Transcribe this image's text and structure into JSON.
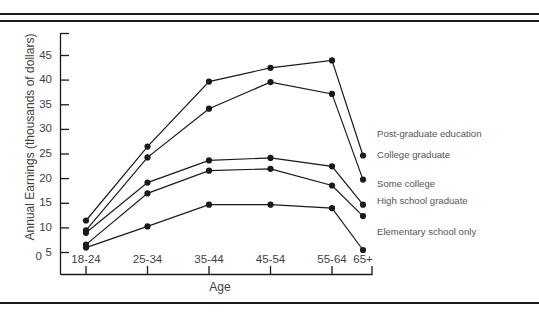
{
  "page": {
    "top_fragment": "",
    "rules": {
      "color": "#1a1a1a"
    }
  },
  "chart_data": {
    "type": "line",
    "title": "",
    "xlabel": "Age",
    "ylabel": "Annual Earnings (thousands of dollars)",
    "categories": [
      "18-24",
      "25-34",
      "35-44",
      "45-54",
      "55-64",
      "65+"
    ],
    "ytick_labels": [
      "45",
      "40",
      "35",
      "30",
      "25",
      "20",
      "15",
      "10",
      "5"
    ],
    "ytick_values": [
      45,
      40,
      35,
      30,
      25,
      20,
      15,
      10,
      5
    ],
    "y_origin_label": "0",
    "ylim": [
      0,
      46
    ],
    "grid": false,
    "legend_position": "right-of-line-ends",
    "marker": "filled-circle",
    "line_color": "#1a1a1a",
    "marker_color": "#1a1a1a",
    "series": [
      {
        "name": "Post-graduate education",
        "values": [
          11.5,
          26.5,
          39.7,
          42.5,
          44.0,
          24.7
        ]
      },
      {
        "name": "College graduate",
        "values": [
          9.5,
          24.3,
          34.2,
          39.6,
          37.2,
          19.8
        ]
      },
      {
        "name": "Some college",
        "values": [
          9.0,
          19.2,
          23.7,
          24.2,
          22.5,
          14.7
        ]
      },
      {
        "name": "High school graduate",
        "values": [
          6.6,
          17.0,
          21.6,
          22.0,
          18.6,
          12.4
        ]
      },
      {
        "name": "Elementary school only",
        "values": [
          6.0,
          10.3,
          14.7,
          14.7,
          14.0,
          5.5
        ]
      }
    ],
    "series_labels": [
      {
        "text": "Post-graduate education",
        "top": 107
      },
      {
        "text": "College graduate",
        "top": 128
      },
      {
        "text": "Some college",
        "top": 157
      },
      {
        "text": "High school graduate",
        "top": 174
      },
      {
        "text": "Elementary school only",
        "top": 205
      }
    ]
  }
}
